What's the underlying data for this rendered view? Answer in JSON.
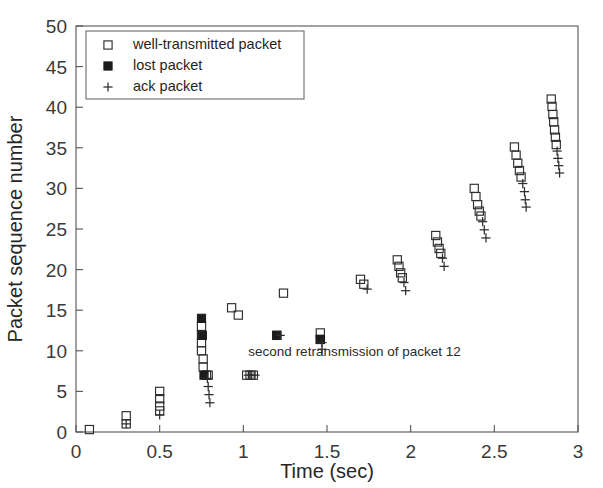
{
  "chart_data": {
    "type": "scatter",
    "title": "",
    "xlabel": "Time (sec)",
    "ylabel": "Packet sequence number",
    "xlim": [
      0,
      3
    ],
    "ylim": [
      0,
      50
    ],
    "xticks": [
      0,
      0.5,
      1,
      1.5,
      2,
      2.5,
      3
    ],
    "xticklabels": [
      "0",
      "0.5",
      "1",
      "1.5",
      "2",
      "2.5",
      "3"
    ],
    "yticks": [
      0,
      5,
      10,
      15,
      20,
      25,
      30,
      35,
      40,
      45,
      50
    ],
    "yticklabels": [
      "0",
      "5",
      "10",
      "15",
      "20",
      "25",
      "30",
      "35",
      "40",
      "45",
      "50"
    ],
    "grid": false,
    "legend_position": "upper-left",
    "legend": [
      {
        "marker": "open-square",
        "label": "well-transmitted packet"
      },
      {
        "marker": "filled-square",
        "label": "lost packet"
      },
      {
        "marker": "plus",
        "label": "ack packet"
      }
    ],
    "annotations": [
      {
        "text": "second retransmission of packet 12",
        "x": 1.03,
        "y": 9.4
      }
    ],
    "series": [
      {
        "name": "well-transmitted packet",
        "marker": "open-square",
        "points": [
          [
            0.08,
            0.3
          ],
          [
            0.3,
            2.0
          ],
          [
            0.3,
            1.0
          ],
          [
            0.5,
            5.0
          ],
          [
            0.5,
            4.1
          ],
          [
            0.5,
            3.2
          ],
          [
            0.5,
            2.6
          ],
          [
            0.75,
            13.0
          ],
          [
            0.75,
            12.0
          ],
          [
            0.75,
            11.0
          ],
          [
            0.75,
            10.0
          ],
          [
            0.76,
            9.0
          ],
          [
            0.76,
            8.0
          ],
          [
            0.78,
            7.0
          ],
          [
            0.79,
            7.0
          ],
          [
            0.93,
            15.3
          ],
          [
            0.97,
            14.4
          ],
          [
            1.02,
            7.0
          ],
          [
            1.04,
            7.0
          ],
          [
            1.06,
            7.0
          ],
          [
            1.2,
            11.9
          ],
          [
            1.24,
            17.1
          ],
          [
            1.46,
            12.2
          ],
          [
            1.46,
            11.4
          ],
          [
            1.7,
            18.8
          ],
          [
            1.72,
            18.2
          ],
          [
            1.92,
            21.2
          ],
          [
            1.93,
            20.4
          ],
          [
            1.94,
            19.6
          ],
          [
            1.95,
            19.0
          ],
          [
            2.15,
            24.2
          ],
          [
            2.16,
            23.4
          ],
          [
            2.17,
            22.6
          ],
          [
            2.18,
            22.0
          ],
          [
            2.38,
            30.0
          ],
          [
            2.39,
            29.0
          ],
          [
            2.4,
            28.0
          ],
          [
            2.41,
            27.2
          ],
          [
            2.42,
            26.6
          ],
          [
            2.62,
            35.1
          ],
          [
            2.63,
            34.1
          ],
          [
            2.64,
            33.1
          ],
          [
            2.65,
            32.2
          ],
          [
            2.66,
            31.4
          ],
          [
            2.84,
            41.0
          ],
          [
            2.845,
            40.1
          ],
          [
            2.85,
            39.1
          ],
          [
            2.855,
            38.2
          ],
          [
            2.86,
            37.2
          ],
          [
            2.865,
            36.3
          ],
          [
            2.87,
            35.4
          ]
        ]
      },
      {
        "name": "lost packet",
        "marker": "filled-square",
        "points": [
          [
            0.75,
            14.0
          ],
          [
            0.755,
            11.9
          ],
          [
            0.765,
            7.0
          ],
          [
            1.2,
            11.9
          ],
          [
            1.46,
            11.4
          ]
        ]
      },
      {
        "name": "ack packet",
        "marker": "plus",
        "points": [
          [
            0.3,
            1.0
          ],
          [
            0.5,
            2.1
          ],
          [
            0.785,
            6.6
          ],
          [
            0.79,
            5.6
          ],
          [
            0.795,
            4.6
          ],
          [
            0.8,
            3.6
          ],
          [
            1.03,
            7.0
          ],
          [
            1.05,
            7.0
          ],
          [
            1.07,
            7.0
          ],
          [
            1.22,
            11.9
          ],
          [
            1.47,
            11.0
          ],
          [
            1.47,
            10.2
          ],
          [
            1.74,
            17.6
          ],
          [
            1.96,
            18.4
          ],
          [
            1.97,
            17.4
          ],
          [
            2.19,
            21.4
          ],
          [
            2.2,
            20.4
          ],
          [
            2.43,
            25.9
          ],
          [
            2.44,
            24.9
          ],
          [
            2.45,
            23.9
          ],
          [
            2.67,
            30.6
          ],
          [
            2.68,
            29.6
          ],
          [
            2.685,
            28.6
          ],
          [
            2.69,
            27.7
          ],
          [
            2.875,
            34.6
          ],
          [
            2.88,
            33.7
          ],
          [
            2.885,
            32.8
          ],
          [
            2.89,
            31.9
          ]
        ]
      }
    ]
  },
  "axes": {
    "x_title": "Time (sec)",
    "y_title": "Packet sequence number"
  }
}
